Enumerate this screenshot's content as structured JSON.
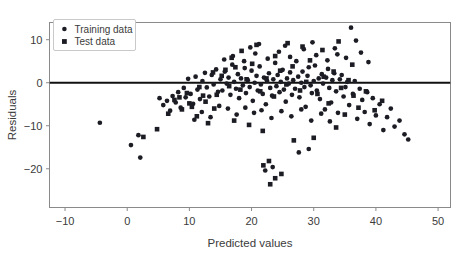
{
  "chart_data": {
    "type": "scatter",
    "title": "",
    "xlabel": "Predicted values",
    "ylabel": "Residuals",
    "xlim": [
      -12.5,
      52.0
    ],
    "ylim": [
      -29.0,
      14.0
    ],
    "xticks": [
      -10,
      0,
      10,
      20,
      30,
      40,
      50
    ],
    "xticklabels": [
      "−10",
      "0",
      "10",
      "20",
      "30",
      "40",
      "50"
    ],
    "yticks": [
      10,
      0,
      -10,
      -20
    ],
    "yticklabels": [
      "10",
      "0",
      "−10",
      "−20"
    ],
    "grid": false,
    "legend": {
      "position": "upper left",
      "entries": [
        {
          "label": "Training data",
          "marker": "circle",
          "color": "#1c1c24"
        },
        {
          "label": "Test data",
          "marker": "square",
          "color": "#1c1c24"
        }
      ]
    },
    "reference_lines": [
      {
        "orientation": "horizontal",
        "value": 0,
        "color": "#111111",
        "width": 2.2
      }
    ],
    "series": [
      {
        "name": "Training data",
        "marker": "circle",
        "color": "#1c1c24",
        "points": [
          [
            -4.4,
            -9.3
          ],
          [
            0.6,
            -14.5
          ],
          [
            1.8,
            -12.2
          ],
          [
            2.1,
            -17.4
          ],
          [
            5.2,
            -3.6
          ],
          [
            5.8,
            -5.2
          ],
          [
            6.4,
            -4.2
          ],
          [
            6.9,
            -6.5
          ],
          [
            7.3,
            -3.1
          ],
          [
            7.8,
            -4.6
          ],
          [
            8.2,
            -2.2
          ],
          [
            8.6,
            -5.8
          ],
          [
            9.1,
            -1.2
          ],
          [
            9.4,
            -3.4
          ],
          [
            9.8,
            0.9
          ],
          [
            10.2,
            -2.6
          ],
          [
            10.6,
            -4.9
          ],
          [
            11.0,
            1.4
          ],
          [
            11.3,
            -1.6
          ],
          [
            11.7,
            -3.8
          ],
          [
            12.1,
            0.4
          ],
          [
            12.5,
            2.3
          ],
          [
            12.8,
            -1.1
          ],
          [
            13.2,
            -3.2
          ],
          [
            13.6,
            1.8
          ],
          [
            13.9,
            -0.4
          ],
          [
            14.3,
            3.1
          ],
          [
            14.6,
            -2.1
          ],
          [
            15.0,
            0.8
          ],
          [
            15.3,
            -1.8
          ],
          [
            15.7,
            2.6
          ],
          [
            16.0,
            -0.2
          ],
          [
            16.3,
            1.2
          ],
          [
            16.6,
            -2.8
          ],
          [
            16.9,
            4.2
          ],
          [
            17.2,
            0.2
          ],
          [
            17.5,
            -1.4
          ],
          [
            17.8,
            2.0
          ],
          [
            18.0,
            -3.6
          ],
          [
            18.3,
            1.0
          ],
          [
            18.6,
            -0.6
          ],
          [
            18.9,
            3.4
          ],
          [
            19.1,
            -2.4
          ],
          [
            19.4,
            0.6
          ],
          [
            19.7,
            -1.0
          ],
          [
            20.0,
            2.8
          ],
          [
            20.2,
            -4.2
          ],
          [
            20.5,
            0.0
          ],
          [
            20.8,
            1.6
          ],
          [
            21.0,
            -1.8
          ],
          [
            21.3,
            3.8
          ],
          [
            21.5,
            -0.4
          ],
          [
            21.8,
            -2.6
          ],
          [
            22.0,
            1.2
          ],
          [
            22.3,
            -5.0
          ],
          [
            22.5,
            0.4
          ],
          [
            22.8,
            2.2
          ],
          [
            23.0,
            -1.2
          ],
          [
            23.3,
            -3.0
          ],
          [
            23.5,
            0.8
          ],
          [
            23.8,
            4.6
          ],
          [
            24.0,
            -0.8
          ],
          [
            24.2,
            1.8
          ],
          [
            24.5,
            -2.2
          ],
          [
            24.7,
            0.2
          ],
          [
            25.0,
            3.0
          ],
          [
            25.2,
            -1.6
          ],
          [
            25.5,
            -4.4
          ],
          [
            25.7,
            1.0
          ],
          [
            26.0,
            -0.2
          ],
          [
            26.2,
            2.4
          ],
          [
            26.5,
            -2.8
          ],
          [
            26.7,
            0.6
          ],
          [
            27.0,
            -1.4
          ],
          [
            27.2,
            5.0
          ],
          [
            27.5,
            1.4
          ],
          [
            27.7,
            -3.4
          ],
          [
            28.0,
            0.0
          ],
          [
            28.2,
            2.6
          ],
          [
            28.5,
            -1.0
          ],
          [
            28.7,
            -5.6
          ],
          [
            29.0,
            1.6
          ],
          [
            29.2,
            3.6
          ],
          [
            29.5,
            -0.6
          ],
          [
            29.7,
            -2.4
          ],
          [
            30.0,
            0.4
          ],
          [
            30.2,
            4.0
          ],
          [
            30.5,
            -1.8
          ],
          [
            30.8,
            1.0
          ],
          [
            31.0,
            -3.8
          ],
          [
            31.3,
            2.0
          ],
          [
            31.5,
            -0.2
          ],
          [
            31.8,
            -6.2
          ],
          [
            32.0,
            1.2
          ],
          [
            32.3,
            3.2
          ],
          [
            32.5,
            -1.2
          ],
          [
            32.8,
            -4.6
          ],
          [
            33.0,
            0.6
          ],
          [
            33.3,
            2.2
          ],
          [
            33.6,
            -2.0
          ],
          [
            33.9,
            -7.0
          ],
          [
            34.2,
            0.8
          ],
          [
            34.5,
            1.8
          ],
          [
            34.8,
            -3.2
          ],
          [
            35.1,
            -1.0
          ],
          [
            35.4,
            0.2
          ],
          [
            35.7,
            -5.2
          ],
          [
            36.0,
            12.8
          ],
          [
            36.3,
            -2.6
          ],
          [
            36.6,
            0.4
          ],
          [
            37.0,
            -8.4
          ],
          [
            37.4,
            -1.4
          ],
          [
            37.8,
            -4.0
          ],
          [
            38.2,
            -6.8
          ],
          [
            38.6,
            -2.2
          ],
          [
            39.0,
            -9.6
          ],
          [
            39.5,
            -3.6
          ],
          [
            40.0,
            -7.6
          ],
          [
            40.6,
            -5.0
          ],
          [
            41.2,
            -11.0
          ],
          [
            41.8,
            -8.0
          ],
          [
            42.4,
            -6.0
          ],
          [
            43.0,
            -10.2
          ],
          [
            43.8,
            -8.8
          ],
          [
            44.6,
            -12.0
          ],
          [
            45.2,
            -13.2
          ],
          [
            12.0,
            -6.8
          ],
          [
            13.4,
            -8.0
          ],
          [
            14.8,
            -5.4
          ],
          [
            10.8,
            -8.6
          ],
          [
            16.2,
            -6.0
          ],
          [
            17.6,
            -7.4
          ],
          [
            19.0,
            -5.8
          ],
          [
            20.4,
            -7.0
          ],
          [
            21.6,
            -6.4
          ],
          [
            23.2,
            -8.2
          ],
          [
            24.8,
            -6.6
          ],
          [
            26.4,
            -7.8
          ],
          [
            28.0,
            -6.2
          ],
          [
            29.6,
            -8.8
          ],
          [
            31.2,
            -7.2
          ],
          [
            32.6,
            -9.0
          ],
          [
            22.2,
            -20.4
          ],
          [
            23.4,
            -19.6
          ],
          [
            27.6,
            -16.2
          ],
          [
            29.2,
            -15.4
          ],
          [
            15.6,
            5.4
          ],
          [
            17.0,
            6.2
          ],
          [
            18.8,
            5.0
          ],
          [
            20.6,
            6.8
          ],
          [
            22.6,
            5.6
          ],
          [
            24.4,
            7.2
          ],
          [
            26.2,
            6.0
          ],
          [
            28.4,
            7.8
          ],
          [
            30.4,
            6.4
          ],
          [
            32.2,
            5.2
          ],
          [
            33.8,
            6.6
          ],
          [
            35.2,
            5.8
          ],
          [
            19.8,
            8.2
          ],
          [
            21.2,
            9.0
          ],
          [
            25.4,
            8.6
          ],
          [
            29.8,
            9.4
          ],
          [
            33.4,
            8.0
          ],
          [
            36.8,
            9.8
          ],
          [
            37.6,
            7.0
          ],
          [
            38.8,
            4.8
          ]
        ]
      },
      {
        "name": "Test data",
        "marker": "square",
        "color": "#1c1c24",
        "points": [
          [
            6.6,
            -7.2
          ],
          [
            7.6,
            -4.0
          ],
          [
            8.4,
            -3.4
          ],
          [
            9.6,
            -2.4
          ],
          [
            10.4,
            -5.6
          ],
          [
            11.6,
            -1.0
          ],
          [
            12.6,
            -4.4
          ],
          [
            13.8,
            2.4
          ],
          [
            14.4,
            -2.8
          ],
          [
            15.2,
            1.6
          ],
          [
            16.4,
            -0.8
          ],
          [
            17.4,
            3.6
          ],
          [
            18.2,
            -1.6
          ],
          [
            19.2,
            0.8
          ],
          [
            20.1,
            4.4
          ],
          [
            21.4,
            -2.0
          ],
          [
            22.4,
            1.0
          ],
          [
            23.6,
            -3.2
          ],
          [
            24.6,
            2.8
          ],
          [
            25.6,
            -0.4
          ],
          [
            26.6,
            3.8
          ],
          [
            27.8,
            -1.8
          ],
          [
            28.8,
            0.2
          ],
          [
            29.4,
            5.2
          ],
          [
            30.6,
            -2.6
          ],
          [
            31.6,
            1.4
          ],
          [
            32.4,
            -4.8
          ],
          [
            33.2,
            2.6
          ],
          [
            34.4,
            -1.2
          ],
          [
            35.6,
            0.6
          ],
          [
            36.4,
            -3.0
          ],
          [
            37.2,
            -5.8
          ],
          [
            38.4,
            -2.0
          ],
          [
            39.8,
            -6.4
          ],
          [
            41.0,
            -4.2
          ],
          [
            2.6,
            -12.6
          ],
          [
            4.8,
            -10.8
          ],
          [
            8.8,
            -6.2
          ],
          [
            11.2,
            -7.8
          ],
          [
            13.0,
            -9.4
          ],
          [
            15.8,
            3.0
          ],
          [
            16.8,
            5.8
          ],
          [
            18.4,
            7.4
          ],
          [
            20.8,
            8.8
          ],
          [
            23.8,
            6.2
          ],
          [
            25.8,
            9.2
          ],
          [
            28.2,
            8.4
          ],
          [
            31.4,
            7.6
          ],
          [
            34.0,
            9.6
          ],
          [
            36.2,
            4.2
          ],
          [
            23.0,
            -23.6
          ],
          [
            23.8,
            -22.2
          ],
          [
            24.8,
            -21.2
          ],
          [
            22.8,
            -18.2
          ],
          [
            21.9,
            -19.2
          ],
          [
            26.8,
            -13.4
          ],
          [
            30.0,
            -12.8
          ],
          [
            17.2,
            -8.8
          ],
          [
            19.6,
            -9.8
          ],
          [
            21.8,
            -11.2
          ],
          [
            33.6,
            -10.4
          ],
          [
            35.0,
            -7.4
          ],
          [
            12.2,
            -3.0
          ],
          [
            14.0,
            -6.0
          ],
          [
            10.0,
            -4.8
          ]
        ]
      }
    ]
  }
}
